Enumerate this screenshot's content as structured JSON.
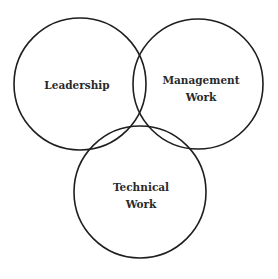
{
  "diagram": {
    "type": "venn",
    "circles": [
      {
        "id": "leadership",
        "label_lines": [
          "Leadership"
        ],
        "cx": 80,
        "cy": 84,
        "r": 66
      },
      {
        "id": "management",
        "label_lines": [
          "Management",
          "Work"
        ],
        "cx": 198,
        "cy": 84,
        "r": 65
      },
      {
        "id": "technical",
        "label_lines": [
          "Technical",
          "Work"
        ],
        "cx": 140,
        "cy": 192,
        "r": 66
      }
    ],
    "stroke_color": "#1e1e1e",
    "text_color": "#2a2a2a",
    "background": "#ffffff"
  }
}
